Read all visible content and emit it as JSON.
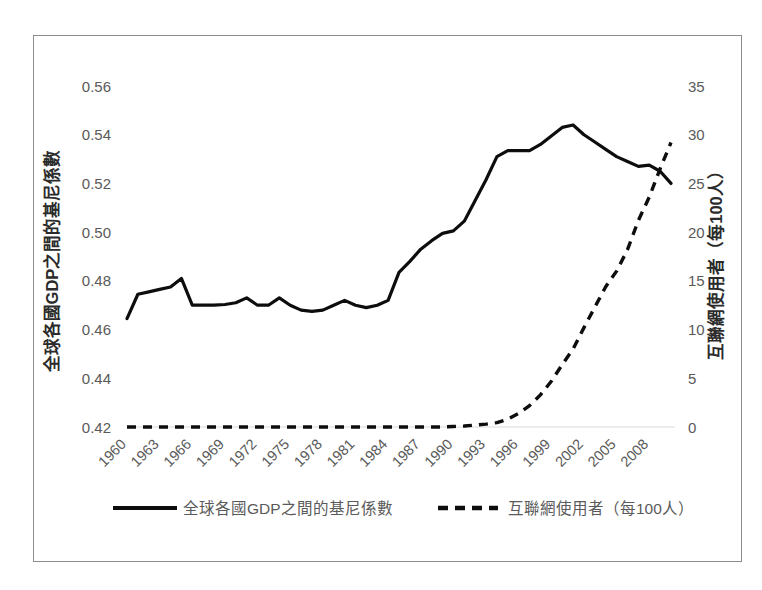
{
  "chart_data": {
    "type": "line",
    "title": "",
    "xlabel": "",
    "ylabel": "全球各國GDP之間的基尼係數",
    "y2label": "互聯網使用者（每100人）",
    "grid": false,
    "legend_position": "bottom",
    "xlim": [
      1960,
      2010
    ],
    "ylim": [
      0.42,
      0.56
    ],
    "y2lim": [
      0,
      35
    ],
    "ytick_labels": [
      "0.56",
      "0.54",
      "0.52",
      "0.50",
      "0.48",
      "0.46",
      "0.44",
      "0.42"
    ],
    "ytick_values": [
      0.56,
      0.54,
      0.52,
      0.5,
      0.48,
      0.46,
      0.44,
      0.42
    ],
    "y2tick_labels": [
      "35",
      "30",
      "25",
      "20",
      "15",
      "10",
      "5",
      "0"
    ],
    "y2tick_values": [
      35,
      30,
      25,
      20,
      15,
      10,
      5,
      0
    ],
    "xtick_labels": [
      "1960",
      "1963",
      "1966",
      "1969",
      "1972",
      "1975",
      "1978",
      "1981",
      "1984",
      "1987",
      "1990",
      "1993",
      "1996",
      "1999",
      "2002",
      "2005",
      "2008"
    ],
    "xtick_values": [
      1960,
      1963,
      1966,
      1969,
      1972,
      1975,
      1978,
      1981,
      1984,
      1987,
      1990,
      1993,
      1996,
      1999,
      2002,
      2005,
      2008
    ],
    "x": [
      1960,
      1961,
      1962,
      1963,
      1964,
      1965,
      1966,
      1967,
      1968,
      1969,
      1970,
      1971,
      1972,
      1973,
      1974,
      1975,
      1976,
      1977,
      1978,
      1979,
      1980,
      1981,
      1982,
      1983,
      1984,
      1985,
      1986,
      1987,
      1988,
      1989,
      1990,
      1991,
      1992,
      1993,
      1994,
      1995,
      1996,
      1997,
      1998,
      1999,
      2000,
      2001,
      2002,
      2003,
      2004,
      2005,
      2006,
      2007,
      2008,
      2009,
      2010
    ],
    "series": [
      {
        "name": "全球各國GDP之間的基尼係數",
        "axis": "left",
        "style": "solid",
        "color": "#0d0d0d",
        "values": [
          0.4645,
          0.4745,
          0.4755,
          0.4765,
          0.4775,
          0.481,
          0.47,
          0.47,
          0.47,
          0.4703,
          0.471,
          0.473,
          0.47,
          0.47,
          0.473,
          0.47,
          0.468,
          0.4675,
          0.468,
          0.47,
          0.472,
          0.47,
          0.469,
          0.47,
          0.472,
          0.4835,
          0.488,
          0.493,
          0.4965,
          0.4995,
          0.5005,
          0.5045,
          0.513,
          0.5215,
          0.531,
          0.5335,
          0.5335,
          0.5335,
          0.536,
          0.5395,
          0.543,
          0.544,
          0.54,
          0.537,
          0.534,
          0.531,
          0.529,
          0.527,
          0.5275,
          0.525,
          0.52
        ]
      },
      {
        "name": "互聯網使用者（每100人）",
        "axis": "right",
        "style": "dashed",
        "color": "#0d0d0d",
        "values": [
          0,
          0,
          0,
          0,
          0,
          0,
          0,
          0,
          0,
          0,
          0,
          0,
          0,
          0,
          0,
          0,
          0,
          0,
          0,
          0,
          0,
          0,
          0,
          0,
          0,
          0,
          0,
          0,
          0,
          0,
          0.05,
          0.1,
          0.2,
          0.3,
          0.45,
          0.8,
          1.4,
          2.2,
          3.3,
          4.7,
          6.4,
          8.0,
          10.2,
          12.3,
          14.4,
          16.0,
          18.2,
          21.2,
          23.6,
          26.5,
          29.2
        ]
      }
    ]
  },
  "legend": {
    "items": [
      {
        "label": "全球各國GDP之間的基尼係數",
        "style": "solid"
      },
      {
        "label": "互聯網使用者（每100人）",
        "style": "dashed"
      }
    ]
  }
}
